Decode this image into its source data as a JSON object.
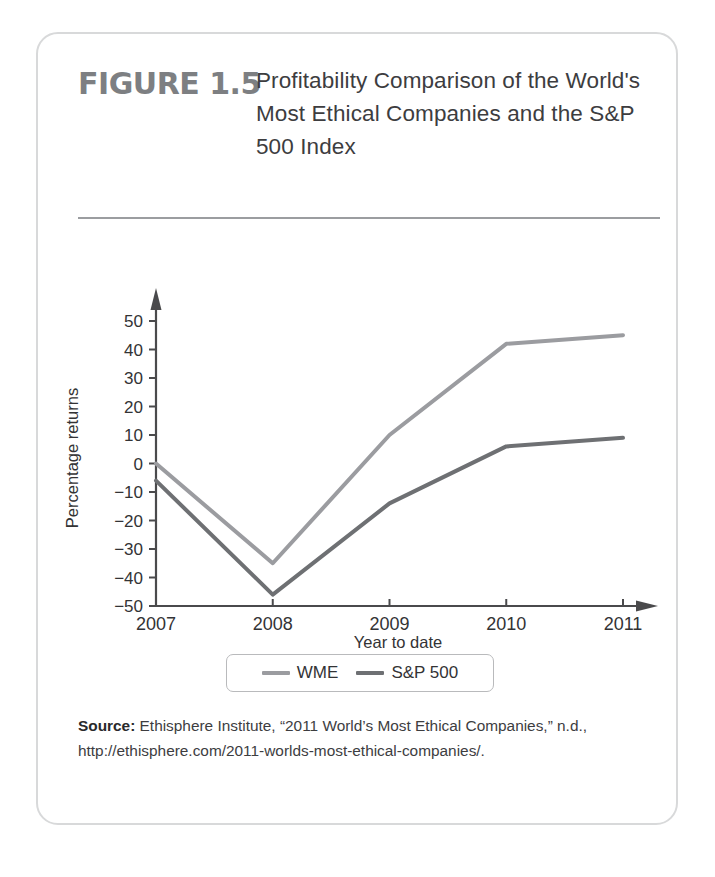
{
  "figure": {
    "number": "FIGURE 1.5",
    "title": "Profitability Comparison of the World's Most Ethical Companies and the S&P 500 Index",
    "source_label": "Source:",
    "source_text": "Ethisphere Institute, “2011 World’s Most Ethical Companies,” n.d., http://ethisphere.com/2011-worlds-most-ethical-companies/."
  },
  "colors": {
    "wme_line": "#9b9ca0",
    "sp500_line": "#6e7073",
    "axis": "#4a4a4c",
    "card_border": "#d8d9da",
    "rule": "#9b9da0",
    "figure_number": "#7d7f82",
    "text": "#3d3d3f"
  },
  "chart_data": {
    "type": "line",
    "title": "Profitability Comparison of the World's Most Ethical Companies and the S&P 500 Index",
    "xlabel": "Year to date",
    "ylabel": "Percentage returns",
    "x": [
      "2007",
      "2008",
      "2009",
      "2010",
      "2011"
    ],
    "categories": [
      "2007",
      "2008",
      "2009",
      "2010",
      "2011"
    ],
    "xlim": [
      2007,
      2011
    ],
    "ylim": [
      -50,
      50
    ],
    "ytick_step": 10,
    "yticks": [
      50,
      40,
      30,
      20,
      10,
      0,
      -10,
      -20,
      -30,
      -40,
      -50
    ],
    "ytick_labels": [
      "50",
      "40",
      "30",
      "20",
      "10",
      "0",
      "−10",
      "−20",
      "−30",
      "−40",
      "−50"
    ],
    "xticks": [
      "2007",
      "2008",
      "2009",
      "2010",
      "2011"
    ],
    "grid": false,
    "legend_position": "bottom-center",
    "series": [
      {
        "name": "WME",
        "color": "#9b9ca0",
        "values": [
          0,
          -35,
          10,
          42,
          45
        ]
      },
      {
        "name": "S&P 500",
        "color": "#6e7073",
        "values": [
          -6,
          -46,
          -14,
          6,
          9
        ]
      }
    ]
  },
  "legend": {
    "entries": [
      {
        "label": "WME",
        "color": "#9b9ca0"
      },
      {
        "label": "S&P 500",
        "color": "#6e7073"
      }
    ]
  }
}
